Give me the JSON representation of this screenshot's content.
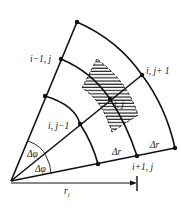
{
  "diagram": {
    "stroke_color": "#111111",
    "labels": {
      "node_top": "i−1, j",
      "node_right": "i, j+ 1",
      "node_center": "i, j",
      "node_left": "i, j−1",
      "node_bottom": "i+1, j",
      "delta_phi_upper": "Δφ",
      "delta_phi_lower": "Δφ",
      "delta_r_inner": "Δr",
      "delta_r_outer": "Δr",
      "radius": "r",
      "radius_subscript": "i"
    }
  }
}
